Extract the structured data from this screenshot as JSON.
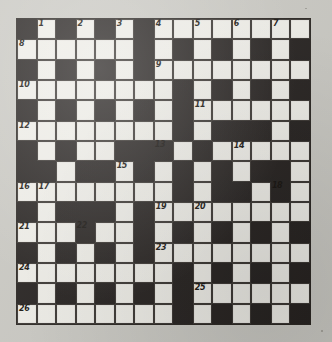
{
  "puzzle": {
    "title": "Crossword Puzzle Grid",
    "kind": "crossword-grid",
    "rows": 15,
    "columns": 15,
    "colors": {
      "block": "#262220",
      "light": "#efeee8",
      "paper": "#cac9c3",
      "ink": "#16130f"
    },
    "legend": {
      "block_label": "blocked square",
      "light_label": "fillable square"
    },
    "grid": [
      "#.#.#.#........",
      "......#.#.#.#.#",
      "#.#.#.#........",
      "........#.#.#.#",
      "#.#.#.#.#......",
      "........#.###.#",
      "#.#..###.#.....",
      "##.##.#.#.#.##.",
      "........#.##.#.",
      "#.###.#........",
      "...#..#.#.#.#.#",
      "#.#.#.#........",
      "........#.#.#.#",
      "#.#.#.#.#......",
      "........#.#.#.#"
    ],
    "numbers": [
      {
        "n": "1",
        "row": 1,
        "col": 2
      },
      {
        "n": "2",
        "row": 1,
        "col": 4
      },
      {
        "n": "3",
        "row": 1,
        "col": 6
      },
      {
        "n": "4",
        "row": 1,
        "col": 8
      },
      {
        "n": "5",
        "row": 1,
        "col": 10
      },
      {
        "n": "6",
        "row": 1,
        "col": 12
      },
      {
        "n": "7",
        "row": 1,
        "col": 14
      },
      {
        "n": "8",
        "row": 2,
        "col": 1
      },
      {
        "n": "9",
        "row": 3,
        "col": 8
      },
      {
        "n": "10",
        "row": 4,
        "col": 1
      },
      {
        "n": "11",
        "row": 5,
        "col": 10
      },
      {
        "n": "12",
        "row": 6,
        "col": 1
      },
      {
        "n": "13",
        "row": 7,
        "col": 8
      },
      {
        "n": "14",
        "row": 7,
        "col": 12
      },
      {
        "n": "15",
        "row": 8,
        "col": 6
      },
      {
        "n": "16",
        "row": 9,
        "col": 1
      },
      {
        "n": "17",
        "row": 9,
        "col": 2
      },
      {
        "n": "18",
        "row": 9,
        "col": 14
      },
      {
        "n": "19",
        "row": 10,
        "col": 8
      },
      {
        "n": "20",
        "row": 10,
        "col": 10
      },
      {
        "n": "21",
        "row": 11,
        "col": 1
      },
      {
        "n": "22",
        "row": 11,
        "col": 4
      },
      {
        "n": "23",
        "row": 12,
        "col": 8
      },
      {
        "n": "24",
        "row": 13,
        "col": 1
      },
      {
        "n": "25",
        "row": 14,
        "col": 10
      },
      {
        "n": "26",
        "row": 15,
        "col": 1
      }
    ],
    "numbers_sequence": "1,2,3,4,5,6,7,8,9,10,11,12,13,14,15,16,17,18,19,20,21,22,23,24,25,26",
    "highest_number": "26"
  }
}
